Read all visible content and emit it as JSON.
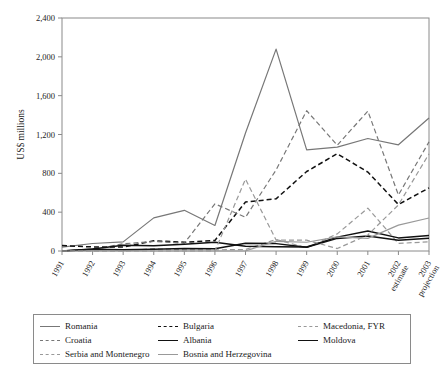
{
  "chart_data": {
    "type": "line",
    "title": "",
    "xlabel": "",
    "ylabel": "US$ millions",
    "ylim": [
      0,
      2400
    ],
    "yticks": [
      0,
      400,
      800,
      1200,
      1600,
      2000,
      2400
    ],
    "ytick_labels": [
      "0",
      "400",
      "800",
      "1,200",
      "1,600",
      "2,000",
      "2,400"
    ],
    "grid": false,
    "legend_position": "bottom",
    "categories": [
      "1991",
      "1992",
      "1993",
      "1994",
      "1995",
      "1996",
      "1997",
      "1998",
      "1999",
      "2000",
      "2001",
      "2002",
      "2003"
    ],
    "xtick_labels": [
      "1991",
      "1992",
      "1993",
      "1994",
      "1995",
      "1996",
      "1997",
      "1998",
      "1999",
      "2000",
      "2001",
      "2002 estimate",
      "2003 projection"
    ],
    "series": [
      {
        "name": "Romania",
        "style": "solid",
        "color": "#777777",
        "width": 1.2,
        "values": [
          40,
          77,
          94,
          341,
          419,
          263,
          1215,
          2079,
          1041,
          1070,
          1159,
          1094,
          1370
        ]
      },
      {
        "name": "Bulgaria",
        "style": "dashed",
        "color": "#111111",
        "width": 1.5,
        "values": [
          56,
          42,
          40,
          105,
          90,
          109,
          505,
          537,
          819,
          1002,
          813,
          479,
          650
        ]
      },
      {
        "name": "Macedonia, FYR",
        "style": "dashed",
        "color": "#999999",
        "width": 1.2,
        "values": [
          0,
          0,
          0,
          24,
          13,
          12,
          16,
          118,
          33,
          176,
          442,
          78,
          95
        ]
      },
      {
        "name": "Croatia",
        "style": "dashed",
        "color": "#777777",
        "width": 1.2,
        "values": [
          0,
          16,
          74,
          98,
          81,
          486,
          347,
          835,
          1445,
          1089,
          1441,
          577,
          1124
        ]
      },
      {
        "name": "Albania",
        "style": "solid",
        "color": "#111111",
        "width": 1.5,
        "values": [
          0,
          20,
          58,
          53,
          70,
          90,
          48,
          45,
          41,
          143,
          207,
          135,
          160
        ]
      },
      {
        "name": "Moldova",
        "style": "solid",
        "color": "#111111",
        "width": 1.5,
        "values": [
          0,
          17,
          14,
          18,
          26,
          23,
          79,
          76,
          38,
          130,
          155,
          111,
          132
        ]
      },
      {
        "name": "Serbia and Montenegro",
        "style": "dashed",
        "color": "#999999",
        "width": 1.2,
        "values": [
          0,
          0,
          0,
          0,
          0,
          0,
          740,
          113,
          112,
          25,
          165,
          475,
          1000
        ]
      },
      {
        "name": "Bosnia and Herzegovina",
        "style": "solid",
        "color": "#999999",
        "width": 1.2,
        "values": [
          0,
          0,
          0,
          0,
          0,
          0,
          1,
          100,
          90,
          146,
          130,
          266,
          340
        ]
      }
    ]
  },
  "axis": {
    "ylabel": "US$ millions"
  },
  "legend": {
    "rows": [
      [
        {
          "label": "Romania",
          "style": "solid",
          "color": "#777777"
        },
        {
          "label": "Bulgaria",
          "style": "dashed",
          "color": "#111111"
        },
        {
          "label": "Macedonia, FYR",
          "style": "dashed",
          "color": "#999999"
        }
      ],
      [
        {
          "label": "Croatia",
          "style": "dashed",
          "color": "#777777"
        },
        {
          "label": "Albania",
          "style": "solid",
          "color": "#111111"
        },
        {
          "label": "Moldova",
          "style": "solid",
          "color": "#111111"
        }
      ],
      [
        {
          "label": "Serbia and Montenegro",
          "style": "dashed",
          "color": "#999999"
        },
        {
          "label": "Bosnia and Herzegovina",
          "style": "solid",
          "color": "#999999"
        }
      ]
    ]
  },
  "colors": {
    "axis": "#8a8a8a",
    "text": "#1a1a1a",
    "background": "#ffffff"
  }
}
